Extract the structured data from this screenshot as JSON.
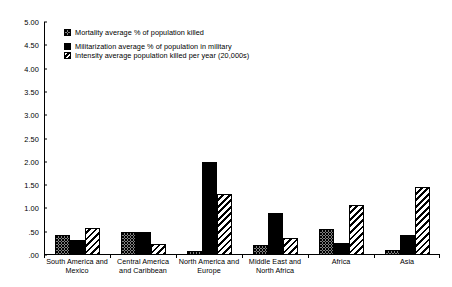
{
  "chart_data": {
    "type": "bar",
    "title": "",
    "subtitle": "",
    "xlabel": "",
    "ylabel": "",
    "ylim": [
      0,
      5
    ],
    "ytick_step": 0.5,
    "ytick_labels": [
      "5.00",
      "4.50",
      "4.00",
      "3.50",
      "3.00",
      "2.50",
      "2.00",
      "1.50",
      "1.00",
      ".50",
      ".00"
    ],
    "ytick_values": [
      5.0,
      4.5,
      4.0,
      3.5,
      3.0,
      2.5,
      2.0,
      1.5,
      1.0,
      0.5,
      0.0
    ],
    "grid": false,
    "legend_position": "upper-left-inside",
    "categories": [
      "South America and Mexico",
      "Central America and Caribbean",
      "North America and Europe",
      "Middle East and North Africa",
      "Africa",
      "Asia"
    ],
    "series": [
      {
        "name": "Mortality average % of population killed",
        "pattern": "dotted",
        "values": [
          0.42,
          0.5,
          0.08,
          0.22,
          0.55,
          0.1
        ]
      },
      {
        "name": "Militarization average % of population in military",
        "pattern": "solid-black",
        "values": [
          0.33,
          0.5,
          2.0,
          0.9,
          0.26,
          0.44
        ]
      },
      {
        "name": "Intensity average population killed per year (20,000s)",
        "pattern": "diagonal-hatch",
        "values": [
          0.58,
          0.24,
          1.3,
          0.36,
          1.07,
          1.47
        ]
      }
    ]
  },
  "legend": {
    "items": [
      {
        "label": "Mortality average % of population killed"
      },
      {
        "label": "Militarization average % of population in military"
      },
      {
        "label": "Intensity average population killed per year (20,000s)"
      }
    ]
  }
}
